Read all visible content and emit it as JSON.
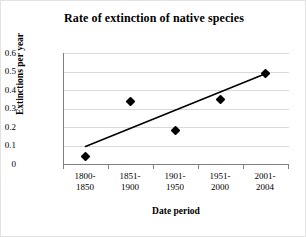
{
  "chart_data": {
    "type": "scatter",
    "title": "Rate of extinction of native species",
    "xlabel": "Date period",
    "ylabel": "Extinctions per year",
    "categories": [
      "1800-1850",
      "1851-1900",
      "1901-1950",
      "1951-2000",
      "2001-2004"
    ],
    "category_lines": [
      [
        "1800-",
        "1850"
      ],
      [
        "1851-",
        "1900"
      ],
      [
        "1901-",
        "1950"
      ],
      [
        "1951-",
        "2000"
      ],
      [
        "2001-",
        "2004"
      ]
    ],
    "values": [
      0.04,
      0.34,
      0.18,
      0.35,
      0.49
    ],
    "ylim": [
      0,
      0.6
    ],
    "ytick_labels": [
      "0.6",
      "0.5",
      "0.4",
      "0.3",
      "0.2",
      "0.1",
      "0"
    ],
    "ytick_values": [
      0.6,
      0.5,
      0.4,
      0.3,
      0.2,
      0.1,
      0
    ],
    "grid": true,
    "grid_axis": "y",
    "legend": "none",
    "series": [
      {
        "name": "Extinctions per year",
        "marker": "diamond",
        "color": "#000000",
        "values": [
          0.04,
          0.34,
          0.18,
          0.35,
          0.49
        ]
      },
      {
        "name": "Linear trendline",
        "type": "line",
        "color": "#000000",
        "start_value": 0.095,
        "end_value": 0.495
      }
    ]
  },
  "chart": {
    "title": "Rate of extinction of native species",
    "y_axis_title": "Extinctions per year",
    "x_axis_title": "Date period",
    "y_ticks": [
      "0.6",
      "0.5",
      "0.4",
      "0.3",
      "0.2",
      "0.1",
      "0"
    ],
    "x_categories": [
      {
        "line1": "1800-",
        "line2": "1850"
      },
      {
        "line1": "1851-",
        "line2": "1900"
      },
      {
        "line1": "1901-",
        "line2": "1950"
      },
      {
        "line1": "1951-",
        "line2": "2000"
      },
      {
        "line1": "2001-",
        "line2": "2004"
      }
    ],
    "colors": {
      "marker": "#000000",
      "trendline": "#000000",
      "gridline": "#d9d9d9",
      "axis": "#7f7f7f",
      "background": "#ffffff"
    }
  }
}
